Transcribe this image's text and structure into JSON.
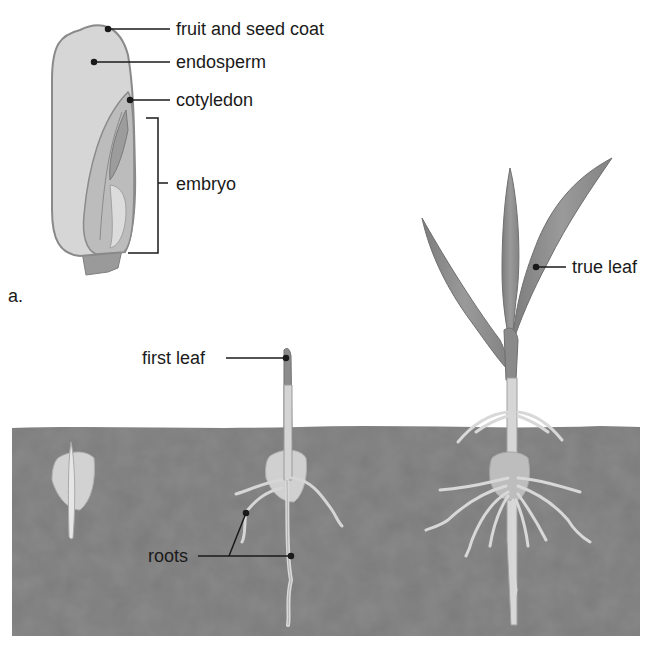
{
  "figure": {
    "panel_label": "a.",
    "seed_section": {
      "labels": {
        "fruit_and_seed_coat": "fruit and seed coat",
        "endosperm": "endosperm",
        "cotyledon": "cotyledon",
        "embryo": "embryo"
      }
    },
    "germination_sequence": {
      "labels": {
        "first_leaf": "first leaf",
        "roots": "roots",
        "true_leaf": "true leaf"
      },
      "stages": [
        "seed in soil",
        "seedling with first leaf",
        "young plant with true leaves"
      ]
    },
    "colors": {
      "soil": "#7a7a7a",
      "seed_body": "#d2d2d2",
      "seed_outline": "#8a8a8a",
      "embryo": "#b5b5b5",
      "leaf": "#8c8c8c",
      "root": "#d8d8d8",
      "text": "#1a1a1a"
    }
  }
}
